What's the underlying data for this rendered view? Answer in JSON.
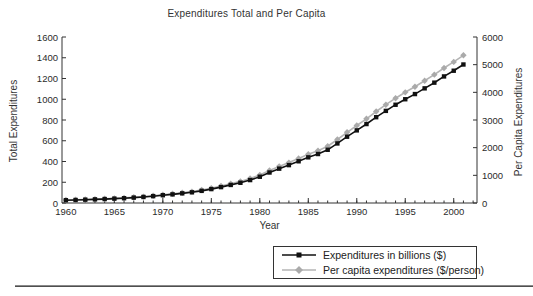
{
  "title": "Expenditures Total and Per Capita",
  "axes": {
    "xlabel": "Year",
    "ylabel_left": "Total Expenditures",
    "ylabel_right": "Per Capita Expenditures"
  },
  "colors": {
    "axis": "#333333",
    "tick_text": "#2b2b2b",
    "series_total": "#111111",
    "series_percap_line": "#b4b4b4",
    "series_percap_marker": "#aaaaaa",
    "rule": "#4f4f4f"
  },
  "chart_data": {
    "type": "line",
    "title": "Expenditures Total and Per Capita",
    "xlabel": "Year",
    "ylabel_left": "Total Expenditures",
    "ylabel_right": "Per Capita Expenditures",
    "grid": false,
    "legend_position": "bottom-right",
    "xlim": [
      1959.6,
      2002.4
    ],
    "ylim_left": [
      0,
      1600
    ],
    "ylim_right": [
      0,
      6000
    ],
    "x_ticks": [
      1960,
      1965,
      1970,
      1975,
      1980,
      1985,
      1990,
      1995,
      2000
    ],
    "x_minor_step": 1,
    "left_ticks": [
      0,
      200,
      400,
      600,
      800,
      1000,
      1200,
      1400,
      1600
    ],
    "right_ticks": [
      0,
      1000,
      2000,
      3000,
      4000,
      5000,
      6000
    ],
    "x": [
      1960,
      1961,
      1962,
      1963,
      1964,
      1965,
      1966,
      1967,
      1968,
      1969,
      1970,
      1971,
      1972,
      1973,
      1974,
      1975,
      1976,
      1977,
      1978,
      1979,
      1980,
      1981,
      1982,
      1983,
      1984,
      1985,
      1986,
      1987,
      1988,
      1989,
      1990,
      1991,
      1992,
      1993,
      1994,
      1995,
      1996,
      1997,
      1998,
      1999,
      2000,
      2001
    ],
    "series": [
      {
        "name": "Expenditures in billions ($)",
        "axis": "left",
        "marker": "square",
        "line_color": "#111111",
        "marker_color": "#111111",
        "values": [
          27,
          29,
          32,
          35,
          38,
          42,
          46,
          52,
          58,
          66,
          75,
          83,
          93,
          103,
          117,
          134,
          153,
          174,
          195,
          221,
          253,
          294,
          331,
          365,
          402,
          440,
          472,
          513,
          574,
          639,
          700,
          761,
          827,
          888,
          947,
          1000,
          1050,
          1105,
          1160,
          1220,
          1275,
          1335
        ]
      },
      {
        "name": "Per capita expenditures ($/person)",
        "axis": "right",
        "marker": "diamond",
        "line_color": "#b4b4b4",
        "marker_color": "#aaaaaa",
        "values": [
          108,
          116,
          128,
          140,
          152,
          168,
          184,
          208,
          232,
          264,
          300,
          332,
          372,
          412,
          468,
          536,
          612,
          696,
          780,
          884,
          1012,
          1176,
          1324,
          1460,
          1608,
          1760,
          1888,
          2052,
          2296,
          2556,
          2800,
          3044,
          3308,
          3552,
          3788,
          4000,
          4200,
          4420,
          4640,
          4880,
          5100,
          5340
        ]
      }
    ]
  },
  "legend": {
    "items": [
      {
        "label": "Expenditures in billions ($)"
      },
      {
        "label": "Per capita expenditures ($/person)"
      }
    ]
  }
}
